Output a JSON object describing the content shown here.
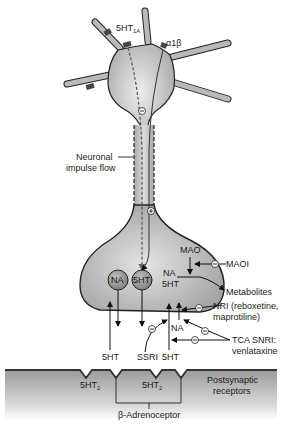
{
  "receptors_presynaptic": {
    "autoreceptor": "5HT",
    "autoreceptor_sub": "1A",
    "alpha": "α1β"
  },
  "axon": {
    "label_line1": "Neuronal",
    "label_line2": "impulse flow",
    "inhibit_symbol": "⊖",
    "excite_symbol": "⊕"
  },
  "terminal": {
    "vesicle_na": "NA",
    "vesicle_5ht": "5HT",
    "mao": "MAO",
    "na": "NA",
    "fivehts": "5HT"
  },
  "drugs": {
    "maoi": "MAOI",
    "metabolites": "Metabolites",
    "nri_line1": "NRI (reboxetine,",
    "nri_line2": "maprotiline)",
    "tca_line1": "TCA SNRI:",
    "tca_line2": "venlataxine",
    "ssri": "SSRI",
    "na_reuptake": "NA"
  },
  "release_labels": {
    "left_5ht": "5HT",
    "right_5ht": "5HT"
  },
  "postsynaptic": {
    "receptor1": "5HT",
    "receptor1_sub": "2",
    "receptor2": "5HT",
    "receptor2_sub": "2",
    "label_line1": "Postsynaptic",
    "label_line2": "receptors",
    "beta": "β-Adrenoceptor"
  },
  "colors": {
    "neuron_fill": "#b5b5b5",
    "neuron_center": "#e6e6e6",
    "outline": "#222222",
    "receptor": "#555555",
    "membrane": "#9a9a9a"
  }
}
